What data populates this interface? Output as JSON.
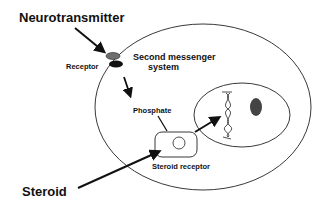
{
  "diagram": {
    "labels": {
      "neurotransmitter": "Neurotransmitter",
      "receptor": "Receptor",
      "second_messenger_line1": "Second messenger",
      "second_messenger_line2": "system",
      "phosphate": "Phosphate",
      "steroid_receptor": "Steroid receptor",
      "steroid": "Steroid"
    },
    "colors": {
      "line": "#111111",
      "receptor_top": "#6e6e6e",
      "receptor_bottom": "#111111",
      "nucleolus": "#444444"
    }
  }
}
